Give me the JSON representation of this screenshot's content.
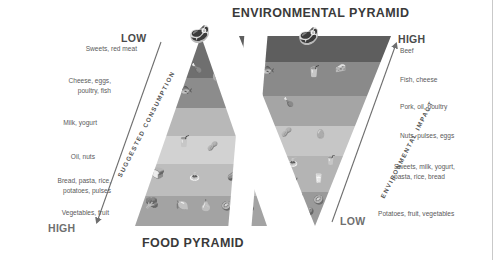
{
  "titles": {
    "environmental": "ENVIRONMENTAL PYRAMID",
    "food": "FOOD PYRAMID"
  },
  "axes": {
    "left_caption": "SUGGESTED CONSUMPTION",
    "right_caption": "ENVIRONMENTAL IMPACT",
    "left_top_word": "LOW",
    "left_bottom_word": "HIGH",
    "right_top_word": "HIGH",
    "right_bottom_word": "LOW"
  },
  "food_pyramid": {
    "labels": [
      "Sweets, red meat",
      "Cheese, eggs,\npoultry, fish",
      "Milk, yogurt",
      "Oil, nuts",
      "Bread, pasta, rice,\npotatoes, pulses",
      "Vegetables, fruit"
    ],
    "band_colors": [
      "#6f6f6f",
      "#8c8c8c",
      "#b8b8b8",
      "#d2d2d2",
      "#bdbdbd",
      "#a3a3a3"
    ],
    "items": [
      [
        "steak"
      ],
      [
        "cheese",
        "poultry-leg",
        "fish",
        "egg"
      ],
      [
        "milk-carton",
        "yogurt-cup"
      ],
      [
        "oil-bottle",
        "nuts"
      ],
      [
        "bread-loaf",
        "pasta",
        "potato"
      ],
      [
        "broccoli",
        "pepper",
        "pear",
        "kiwi",
        "eggplant"
      ]
    ]
  },
  "environmental_pyramid": {
    "labels": [
      "Beef",
      "Fish, cheese",
      "Pork, oil, poultry",
      "Nuts, pulses, eggs",
      "Sweets, milk, yogurt,\npasta, rice, bread",
      "Potatoes, fruit, vegetables"
    ],
    "band_colors": [
      "#5e5e5e",
      "#8a8a8a",
      "#a5a5a5",
      "#c6c6c6",
      "#b4b4b4",
      "#9a9a9a"
    ],
    "items": [
      [
        "steak"
      ],
      [
        "fish",
        "cheese",
        "oil-bottle"
      ],
      [
        "poultry-leg"
      ],
      [
        "nuts",
        "egg"
      ],
      [
        "pasta",
        "yogurt-cup",
        "bread-loaf",
        "milk-carton"
      ],
      [
        "broccoli",
        "kiwi",
        "potato"
      ]
    ]
  },
  "colors": {
    "title": "#3a3a3a",
    "label": "#5a5a5a",
    "scaleword": "#4a4a4a",
    "arrow": "#6e6e6e",
    "background": "#ffffff"
  }
}
